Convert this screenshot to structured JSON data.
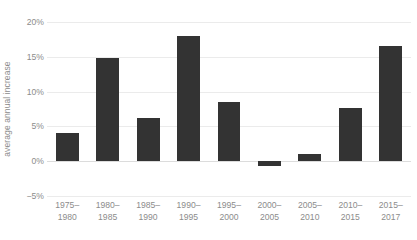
{
  "chart_data": {
    "type": "bar",
    "title": "",
    "subtitle": "",
    "xlabel": "",
    "ylabel": "average annual increase",
    "categories": [
      "1975–1980",
      "1980–1985",
      "1985–1990",
      "1990–1995",
      "1995–2000",
      "2000–2005",
      "2005–2010",
      "2010–2015",
      "2015–2017"
    ],
    "category_lines": [
      [
        "1975–",
        "1980"
      ],
      [
        "1980–",
        "1985"
      ],
      [
        "1985–",
        "1990"
      ],
      [
        "1990–",
        "1995"
      ],
      [
        "1995–",
        "2000"
      ],
      [
        "2000–",
        "2005"
      ],
      [
        "2005–",
        "2010"
      ],
      [
        "2010–",
        "2015"
      ],
      [
        "2015–",
        "2017"
      ]
    ],
    "values": [
      4.0,
      14.8,
      6.2,
      18.0,
      8.5,
      -0.7,
      1.1,
      7.6,
      16.6
    ],
    "value_labels": [
      "4%",
      "14.8%",
      "6.2%",
      "18%",
      "8.5%",
      "-0.7%",
      "1.1%",
      "7.6%",
      "16.6%"
    ],
    "unit": "%",
    "ylim": [
      -5,
      20
    ],
    "yticks": [
      20,
      15,
      10,
      5,
      0,
      -5
    ],
    "ytick_labels": [
      "20%",
      "15%",
      "10%",
      "5%",
      "0%",
      "−5%"
    ],
    "grid": true,
    "legend": false,
    "legend_position": "none",
    "bar_color": "#333333",
    "gridline_color": "#ebebeb",
    "axis_text_color": "#8c8c8c",
    "background_color": "#ffffff"
  }
}
